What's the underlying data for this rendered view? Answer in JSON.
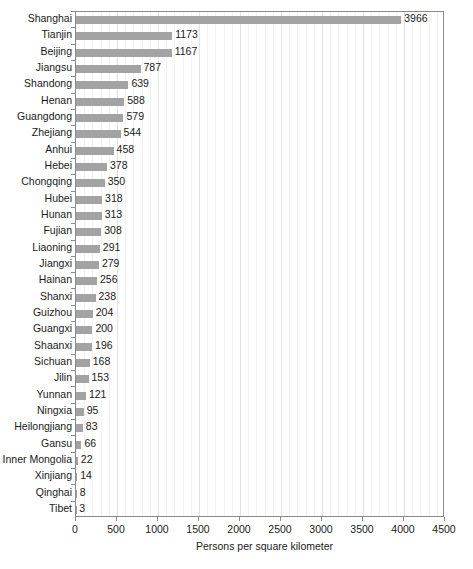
{
  "chart_data": {
    "type": "bar",
    "orientation": "horizontal",
    "title": "",
    "subtitle": "",
    "xlabel": "Persons per square kilometer",
    "ylabel": "",
    "xlim": [
      0,
      4500
    ],
    "ylim": null,
    "grid": true,
    "grid_axis": "x",
    "minor_grid": true,
    "minor_grid_step": 100,
    "legend": false,
    "legend_position": "none",
    "value_labels": true,
    "xticks": [
      0,
      500,
      1000,
      1500,
      2000,
      2500,
      3000,
      3500,
      4000,
      4500
    ],
    "xticklabels": [
      "0",
      "500",
      "1000",
      "1500",
      "2000",
      "2500",
      "3000",
      "3500",
      "4000",
      "4500"
    ],
    "categories": [
      "Shanghai",
      "Tianjin",
      "Beijing",
      "Jiangsu",
      "Shandong",
      "Henan",
      "Guangdong",
      "Zhejiang",
      "Anhui",
      "Hebei",
      "Chongqing",
      "Hubei",
      "Hunan",
      "Fujian",
      "Liaoning",
      "Jiangxi",
      "Hainan",
      "Shanxi",
      "Guizhou",
      "Guangxi",
      "Shaanxi",
      "Sichuan",
      "Jilin",
      "Yunnan",
      "Ningxia",
      "Heilongjiang",
      "Gansu",
      "Inner Mongolia",
      "Xinjiang",
      "Qinghai",
      "Tibet"
    ],
    "values": [
      3966,
      1173,
      1167,
      787,
      639,
      588,
      579,
      544,
      458,
      378,
      350,
      318,
      313,
      308,
      291,
      279,
      256,
      238,
      204,
      200,
      196,
      168,
      153,
      121,
      95,
      83,
      66,
      22,
      14,
      8,
      3
    ],
    "value_label_texts": [
      "3966",
      "1173",
      "1167",
      "787",
      "639",
      "588",
      "579",
      "544",
      "458",
      "378",
      "350",
      "318",
      "313",
      "308",
      "291",
      "279",
      "256",
      "238",
      "204",
      "200",
      "196",
      "168",
      "153",
      "121",
      "95",
      "83",
      "66",
      "22",
      "14",
      "8",
      "3"
    ],
    "bar_color": "#a3a3a3",
    "axis_color": "#8a8a8a",
    "background_color": "#ffffff",
    "text_color": "#1a1a1a"
  }
}
